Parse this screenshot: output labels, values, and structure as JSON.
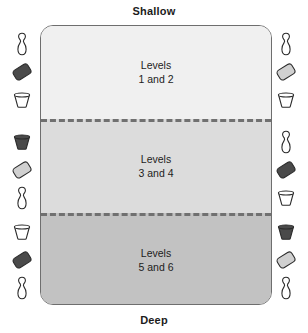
{
  "figure": {
    "name": "swimming-pool-level-zones-diagram",
    "captions": {
      "top": "Shallow",
      "bottom": "Deep"
    },
    "pool": {
      "border_color": "#6e6e6e",
      "zones": [
        {
          "id": "shallow",
          "label_line1": "Levels",
          "label_line2": "1 and 2",
          "fill": "#f0f0f0"
        },
        {
          "id": "mid",
          "label_line1": "Levels",
          "label_line2": "3 and 4",
          "fill": "#dcdcdc"
        },
        {
          "id": "deep",
          "label_line1": "Levels",
          "label_line2": "5 and 6",
          "fill": "#c2c2c2"
        }
      ],
      "divider_color": "#707070",
      "divider_style": "dashed"
    },
    "equipment_groups": [
      {
        "id": "left-top",
        "side": "left",
        "items": [
          {
            "icon": "bowling-pin-icon",
            "fill": "#ffffff"
          },
          {
            "icon": "kickboard-icon",
            "fill": "#4a4a4a"
          },
          {
            "icon": "bucket-icon",
            "fill": "#ffffff"
          }
        ]
      },
      {
        "id": "left-mid",
        "side": "left",
        "items": [
          {
            "icon": "bucket-icon",
            "fill": "#4a4a4a"
          },
          {
            "icon": "kickboard-icon",
            "fill": "#d0d0d0"
          },
          {
            "icon": "bowling-pin-icon",
            "fill": "#ffffff"
          }
        ]
      },
      {
        "id": "left-bottom",
        "side": "left",
        "items": [
          {
            "icon": "bucket-icon",
            "fill": "#ffffff"
          },
          {
            "icon": "kickboard-icon",
            "fill": "#4a4a4a"
          },
          {
            "icon": "bowling-pin-icon",
            "fill": "#ffffff"
          }
        ]
      },
      {
        "id": "right-top",
        "side": "right",
        "items": [
          {
            "icon": "bowling-pin-icon",
            "fill": "#ffffff"
          },
          {
            "icon": "kickboard-icon",
            "fill": "#d0d0d0"
          },
          {
            "icon": "bucket-icon",
            "fill": "#ffffff"
          }
        ]
      },
      {
        "id": "right-mid",
        "side": "right",
        "items": [
          {
            "icon": "bowling-pin-icon",
            "fill": "#ffffff"
          },
          {
            "icon": "kickboard-icon",
            "fill": "#4a4a4a"
          },
          {
            "icon": "bucket-icon",
            "fill": "#ffffff"
          }
        ]
      },
      {
        "id": "right-bottom",
        "side": "right",
        "items": [
          {
            "icon": "bucket-icon",
            "fill": "#4a4a4a"
          },
          {
            "icon": "kickboard-icon",
            "fill": "#d0d0d0"
          },
          {
            "icon": "bowling-pin-icon",
            "fill": "#ffffff"
          }
        ]
      }
    ]
  }
}
